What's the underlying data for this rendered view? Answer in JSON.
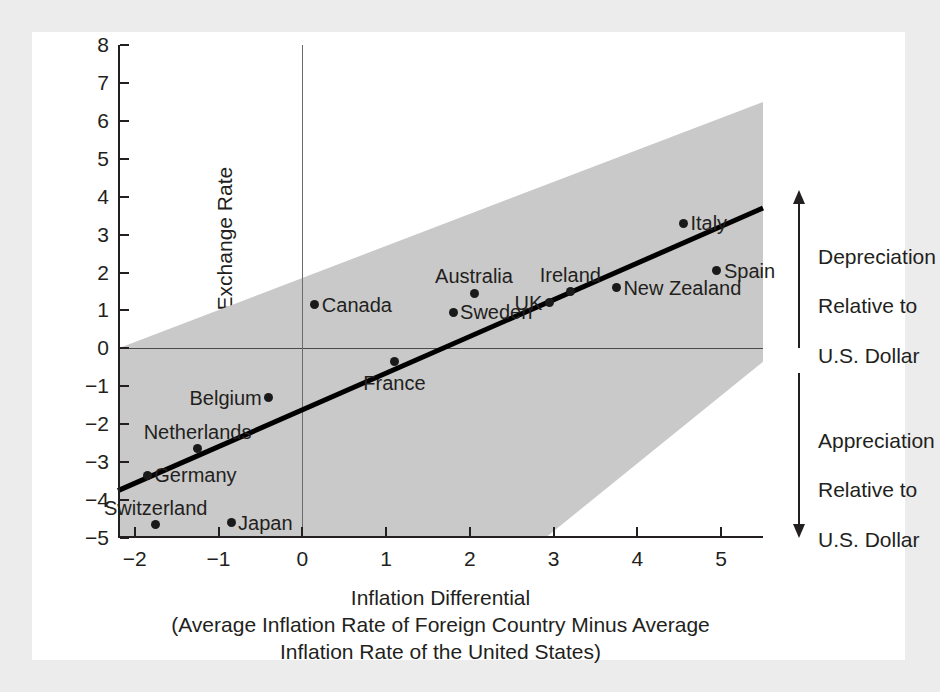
{
  "chart_data": {
    "type": "scatter",
    "title": "",
    "xlabel": "Inflation Differential\n(Average Inflation Rate of Foreign Country Minus Average\nInflation Rate of the United States)",
    "xlabel_line1": "Inflation Differential",
    "xlabel_line2": "(Average Inflation Rate of Foreign Country Minus Average",
    "xlabel_line3": "Inflation Rate of the United States)",
    "ylabel": "Percentage Change in Exchange Rate",
    "xlim": [
      -2.2,
      5.5
    ],
    "ylim": [
      -5,
      8
    ],
    "xticks": [
      -2,
      -1,
      0,
      1,
      2,
      3,
      4,
      5
    ],
    "xticklabels": [
      "−2",
      "−1",
      "0",
      "1",
      "2",
      "3",
      "4",
      "5"
    ],
    "yticks": [
      -5,
      -4,
      -3,
      -2,
      -1,
      0,
      1,
      2,
      3,
      4,
      5,
      6,
      7,
      8
    ],
    "yticklabels": [
      "−5",
      "−4",
      "−3",
      "−2",
      "−1",
      "0",
      "1",
      "2",
      "3",
      "4",
      "5",
      "6",
      "7",
      "8"
    ],
    "grid": false,
    "legend": "none",
    "points": [
      {
        "name": "Germany",
        "x": -1.85,
        "y": -3.35,
        "label_pos": "right"
      },
      {
        "name": "Switzerland",
        "x": -1.75,
        "y": -4.65,
        "label_pos": "above"
      },
      {
        "name": "Netherlands",
        "x": -1.25,
        "y": -2.65,
        "label_pos": "above"
      },
      {
        "name": "Japan",
        "x": -0.85,
        "y": -4.6,
        "label_pos": "right"
      },
      {
        "name": "Belgium",
        "x": -0.4,
        "y": -1.3,
        "label_pos": "left"
      },
      {
        "name": "Canada",
        "x": 0.15,
        "y": 1.15,
        "label_pos": "right"
      },
      {
        "name": "France",
        "x": 1.1,
        "y": -0.35,
        "label_pos": "below"
      },
      {
        "name": "Sweden",
        "x": 1.8,
        "y": 0.95,
        "label_pos": "right"
      },
      {
        "name": "Australia",
        "x": 2.05,
        "y": 1.45,
        "label_pos": "above"
      },
      {
        "name": "UK",
        "x": 2.95,
        "y": 1.2,
        "label_pos": "left"
      },
      {
        "name": "Ireland",
        "x": 3.2,
        "y": 1.5,
        "label_pos": "above"
      },
      {
        "name": "New Zealand",
        "x": 3.75,
        "y": 1.6,
        "label_pos": "right"
      },
      {
        "name": "Italy",
        "x": 4.55,
        "y": 3.3,
        "label_pos": "right"
      },
      {
        "name": "Spain",
        "x": 4.95,
        "y": 2.05,
        "label_pos": "right"
      }
    ],
    "fit_line": {
      "x0": -2.2,
      "y0": -3.75,
      "x1": 5.5,
      "y1": 3.7,
      "description": "regression line"
    },
    "band": {
      "description": "shaded region around the regression line",
      "upper": [
        {
          "x": -2.2,
          "y": 0
        },
        {
          "x": 5.5,
          "y": 6.5
        }
      ],
      "lower": [
        {
          "x": -2.2,
          "y": -5
        },
        {
          "x": 2.9,
          "y": -5
        },
        {
          "x": 5.5,
          "y": -0.35
        }
      ],
      "color": "#c9c9c9"
    }
  },
  "annotations": {
    "depreciation": {
      "line1": "Depreciation",
      "line2": "Relative to",
      "line3": "U.S. Dollar",
      "arrow": "up-arrow-icon"
    },
    "appreciation": {
      "line1": "Appreciation",
      "line2": "Relative to",
      "line3": "U.S. Dollar",
      "arrow": "down-arrow-icon"
    }
  },
  "colors": {
    "page_background": "#ececed",
    "card_background": "#ffffff",
    "axis": "#231f20",
    "band": "#c9c9c9",
    "point": "#1a1a1a",
    "fit_line": "#000000"
  }
}
